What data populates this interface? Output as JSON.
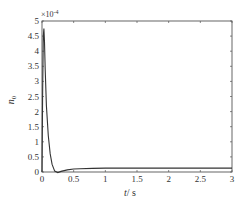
{
  "chart_data": {
    "type": "line",
    "title": "",
    "xlabel": "t / s",
    "ylabel": "n0",
    "y_multiplier": "×10⁻⁴",
    "xlim": [
      0,
      3
    ],
    "ylim": [
      0,
      5
    ],
    "grid": false,
    "legend": null,
    "x_ticks": [
      "0",
      "0.5",
      "1",
      "1.5",
      "2",
      "2.5",
      "3"
    ],
    "y_ticks": [
      "0",
      "0.5",
      "1",
      "1.5",
      "2",
      "2.5",
      "3",
      "3.5",
      "4",
      "4.5",
      "5"
    ],
    "series": [
      {
        "name": "n0",
        "color": "#333333",
        "x": [
          0,
          0.01,
          0.02,
          0.03,
          0.04,
          0.05,
          0.07,
          0.1,
          0.13,
          0.16,
          0.2,
          0.25,
          0.3,
          0.4,
          0.5,
          0.6,
          0.8,
          1.0,
          1.5,
          2.0,
          2.5,
          3.0
        ],
        "values": [
          0,
          2.5,
          4.5,
          4.75,
          4.3,
          3.4,
          2.2,
          1.2,
          0.6,
          0.25,
          0.03,
          -0.02,
          0.02,
          0.07,
          0.1,
          0.11,
          0.12,
          0.13,
          0.13,
          0.13,
          0.13,
          0.13
        ]
      }
    ]
  },
  "axes": {
    "multiplier": "×10",
    "multiplier_exp": "-4",
    "xlabel_var": "t",
    "xlabel_unit": "/ s",
    "ylabel_var": "n",
    "ylabel_sub": "0"
  }
}
